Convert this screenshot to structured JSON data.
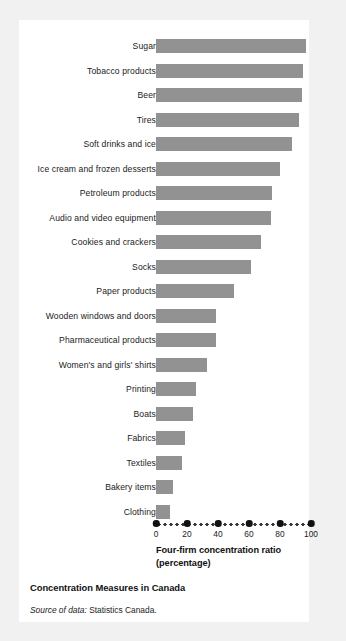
{
  "figure": {
    "title": "Concentration Measures in Canada",
    "source_lead": "Source of data:",
    "source_text": "Statistics Canada.",
    "bar_color": "#929292",
    "panel_color": "#ffffff",
    "background_color": "#f1f1f1"
  },
  "chart_data": {
    "type": "bar",
    "orientation": "horizontal",
    "title": "Concentration Measures in Canada",
    "xlabel": "Four-firm concentration ratio (percentage)",
    "xlabel_line1": "Four-firm concentration ratio",
    "xlabel_line2": "(percentage)",
    "ylabel": "",
    "xlim": [
      0,
      100
    ],
    "xticks": [
      0,
      20,
      40,
      60,
      80,
      100
    ],
    "xtick_labels": [
      "0",
      "20",
      "40",
      "60",
      "80",
      "100"
    ],
    "grid": false,
    "legend": false,
    "categories": [
      "Sugar",
      "Tobacco products",
      "Beer",
      "Tires",
      "Soft drinks and ice",
      "Ice cream and frozen desserts",
      "Petroleum products",
      "Audio and video equipment",
      "Cookies and crackers",
      "Socks",
      "Paper products",
      "Wooden windows and doors",
      "Pharmaceutical products",
      "Women's and girls' shirts",
      "Printing",
      "Boats",
      "Fabrics",
      "Textiles",
      "Bakery items",
      "Clothing"
    ],
    "values": [
      97,
      95,
      94,
      92,
      88,
      80,
      75,
      74,
      68,
      61,
      50,
      39,
      39,
      33,
      26,
      24,
      19,
      17,
      11,
      9
    ]
  }
}
